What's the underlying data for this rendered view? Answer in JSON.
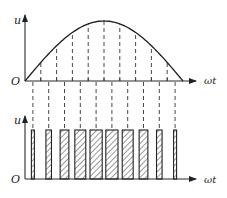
{
  "figure": {
    "top_plot": {
      "y_label": "u",
      "x_label": "ωt",
      "origin_label": "O",
      "waveform": "sine half-period",
      "segments": 10
    },
    "bottom_plot": {
      "y_label": "u",
      "x_label": "ωt",
      "origin_label": "O",
      "pulse_count": 10,
      "pulse_amplitude_relative": 1.0,
      "pulse_width_relative": [
        0.16,
        0.45,
        0.71,
        0.89,
        0.99,
        0.99,
        0.89,
        0.71,
        0.45,
        0.16
      ],
      "fill": "diagonal hatch"
    },
    "colors": {
      "line": "#222222",
      "background": "#ffffff"
    }
  }
}
